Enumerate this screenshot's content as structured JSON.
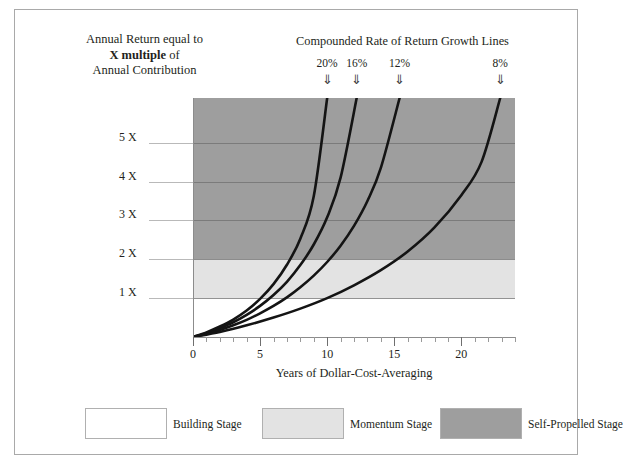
{
  "header": {
    "left_caption_line1": "Annual Return equal to",
    "left_caption_bold": "X multiple",
    "left_caption_of": " of",
    "left_caption_line3": "Annual Contribution",
    "growth_caption": "Compounded Rate of Return Growth Lines",
    "arrow_glyph": "⇓"
  },
  "chart_data": {
    "type": "line",
    "title": "Compounded Rate of Return Growth Lines",
    "xlabel": "Years of Dollar-Cost-Averaging",
    "ylabel": "Annual Return equal to X multiple of Annual Contribution",
    "xlim": [
      0,
      24
    ],
    "ylim": [
      0,
      6.15
    ],
    "grid": true,
    "legend_position": "below-plot",
    "x_ticks": [
      0,
      5,
      10,
      15,
      20
    ],
    "x_tick_labels": [
      "0",
      "5",
      "10",
      "15",
      "20"
    ],
    "x_minor_tick_step": 1,
    "y_ticks": [
      1,
      2,
      3,
      4,
      5
    ],
    "y_tick_labels": [
      "1 X",
      "2 X",
      "3 X",
      "4 X",
      "5 X"
    ],
    "series": [
      {
        "name": "20%",
        "rate_percent": 20,
        "color": "#141414",
        "end_year": 10.0,
        "end_value": 6.15,
        "points": [
          {
            "x": 0,
            "y": 0
          },
          {
            "x": 1,
            "y": 0.12
          },
          {
            "x": 2,
            "y": 0.27
          },
          {
            "x": 3,
            "y": 0.45
          },
          {
            "x": 4,
            "y": 0.68
          },
          {
            "x": 5,
            "y": 0.98
          },
          {
            "x": 6,
            "y": 1.36
          },
          {
            "x": 7,
            "y": 1.86
          },
          {
            "x": 8,
            "y": 2.53
          },
          {
            "x": 9,
            "y": 3.62
          },
          {
            "x": 10,
            "y": 6.15
          }
        ]
      },
      {
        "name": "16%",
        "rate_percent": 16,
        "color": "#141414",
        "end_year": 12.2,
        "end_value": 6.15,
        "points": [
          {
            "x": 0,
            "y": 0
          },
          {
            "x": 1,
            "y": 0.1
          },
          {
            "x": 2,
            "y": 0.23
          },
          {
            "x": 3,
            "y": 0.38
          },
          {
            "x": 4,
            "y": 0.57
          },
          {
            "x": 5,
            "y": 0.8
          },
          {
            "x": 6,
            "y": 1.08
          },
          {
            "x": 7,
            "y": 1.42
          },
          {
            "x": 8,
            "y": 1.85
          },
          {
            "x": 9,
            "y": 2.38
          },
          {
            "x": 10,
            "y": 3.08
          },
          {
            "x": 11,
            "y": 4.1
          },
          {
            "x": 12.2,
            "y": 6.15
          }
        ]
      },
      {
        "name": "12%",
        "rate_percent": 12,
        "color": "#141414",
        "end_year": 15.4,
        "end_value": 6.15,
        "points": [
          {
            "x": 0,
            "y": 0
          },
          {
            "x": 1,
            "y": 0.08
          },
          {
            "x": 2,
            "y": 0.18
          },
          {
            "x": 3,
            "y": 0.3
          },
          {
            "x": 4,
            "y": 0.44
          },
          {
            "x": 5,
            "y": 0.61
          },
          {
            "x": 6,
            "y": 0.8
          },
          {
            "x": 7,
            "y": 1.02
          },
          {
            "x": 8,
            "y": 1.28
          },
          {
            "x": 9,
            "y": 1.58
          },
          {
            "x": 10,
            "y": 1.93
          },
          {
            "x": 11,
            "y": 2.35
          },
          {
            "x": 12,
            "y": 2.86
          },
          {
            "x": 13,
            "y": 3.5
          },
          {
            "x": 14,
            "y": 4.35
          },
          {
            "x": 15.4,
            "y": 6.15
          }
        ]
      },
      {
        "name": "8%",
        "rate_percent": 8,
        "color": "#141414",
        "end_year": 22.9,
        "end_value": 6.15,
        "points": [
          {
            "x": 0,
            "y": 0
          },
          {
            "x": 2,
            "y": 0.13
          },
          {
            "x": 4,
            "y": 0.3
          },
          {
            "x": 6,
            "y": 0.5
          },
          {
            "x": 8,
            "y": 0.73
          },
          {
            "x": 10,
            "y": 1.0
          },
          {
            "x": 12,
            "y": 1.33
          },
          {
            "x": 14,
            "y": 1.72
          },
          {
            "x": 16,
            "y": 2.2
          },
          {
            "x": 18,
            "y": 2.82
          },
          {
            "x": 20,
            "y": 3.65
          },
          {
            "x": 21.5,
            "y": 4.5
          },
          {
            "x": 22.9,
            "y": 6.15
          }
        ]
      }
    ],
    "bands": [
      {
        "name": "Self-Propelled Stage",
        "from": 2,
        "to": 6.15,
        "color": "#9e9e9e"
      },
      {
        "name": "Momentum Stage",
        "from": 1,
        "to": 2,
        "color": "#e3e3e3"
      },
      {
        "name": "Building Stage",
        "from": 0,
        "to": 1,
        "color": "#ffffff"
      }
    ]
  },
  "legend": [
    {
      "label": "Building Stage",
      "color": "#ffffff"
    },
    {
      "label": "Momentum Stage",
      "color": "#e3e3e3"
    },
    {
      "label": "Self-Propelled Stage",
      "color": "#9e9e9e"
    }
  ]
}
